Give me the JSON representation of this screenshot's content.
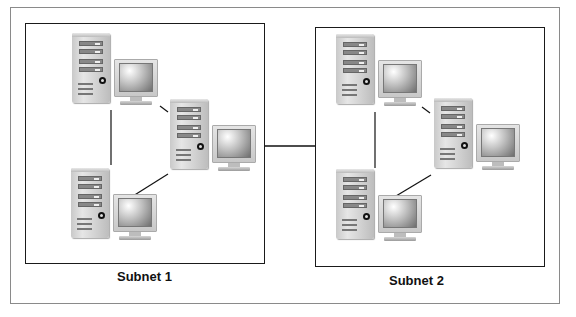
{
  "header": {
    "cut_title": "…igure … Subnets"
  },
  "subnets": [
    {
      "label": "Subnet 1",
      "computers": [
        "computer-1",
        "computer-2",
        "computer-3"
      ]
    },
    {
      "label": "Subnet 2",
      "computers": [
        "computer-1",
        "computer-2",
        "computer-3"
      ]
    }
  ],
  "icons": {
    "computer": "desktop-computer-icon",
    "tower": "tower-case",
    "monitor": "crt-monitor"
  },
  "colors": {
    "frame": "#8a8a8a",
    "subnet_border": "#1a1a1a",
    "link": "#111111",
    "background": "#ffffff"
  }
}
